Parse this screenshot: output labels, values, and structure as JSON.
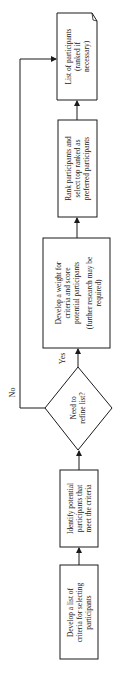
{
  "diagram": {
    "type": "flowchart",
    "orientation": "rotated-90-ccw",
    "nodes": [
      {
        "id": "n1",
        "shape": "process",
        "lines": [
          "Develop a list of",
          "criteria for selecting",
          "participants"
        ]
      },
      {
        "id": "n2",
        "shape": "process",
        "lines": [
          "Identify potential",
          "participants that",
          "meet the criteria"
        ]
      },
      {
        "id": "n3",
        "shape": "decision",
        "lines": [
          "Need to",
          "refine list?"
        ]
      },
      {
        "id": "n4",
        "shape": "process",
        "lines": [
          "Develop a weight for",
          "criteria and score",
          "potential participants"
        ],
        "note_lines": [
          "(further research may be",
          "required)"
        ]
      },
      {
        "id": "n5",
        "shape": "process",
        "lines": [
          "Rank participants and",
          "select top ranked as",
          "preferred participants"
        ]
      },
      {
        "id": "n6",
        "shape": "document",
        "lines": [
          "List of participants",
          "(ranked if",
          "necessary)"
        ]
      }
    ],
    "edges": [
      {
        "from": "n1",
        "to": "n2",
        "label": ""
      },
      {
        "from": "n2",
        "to": "n3",
        "label": ""
      },
      {
        "from": "n3",
        "to": "n4",
        "label": "Yes"
      },
      {
        "from": "n3",
        "to": "n6",
        "label": "No"
      },
      {
        "from": "n4",
        "to": "n5",
        "label": ""
      },
      {
        "from": "n5",
        "to": "n6",
        "label": ""
      }
    ]
  },
  "colors": {
    "stroke": "#1a1a1a",
    "background": "#ffffff",
    "text": "#222222"
  }
}
